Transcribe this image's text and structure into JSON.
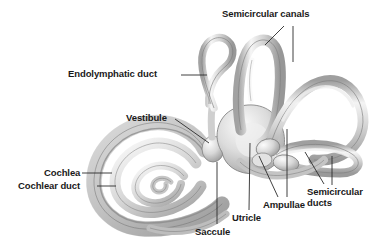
{
  "figure": {
    "style": "grayscale anatomical illustration",
    "background_color": "#ffffff",
    "label_color": "#1a1a1a",
    "leader_color": "#2b2b2b",
    "structure_fill_light": "#fdfdfd",
    "structure_fill_mid": "#c9c9c9",
    "structure_fill_dark": "#8f8f8f",
    "structure_outline": "#6e6e6e"
  },
  "labels": [
    {
      "id": "semicircular-canals",
      "text": "Semicircular canals",
      "x": 222,
      "y": 8,
      "lines": 1
    },
    {
      "id": "endolymphatic-duct",
      "text": "Endolymphatic duct",
      "x": 68,
      "y": 68,
      "lines": 1
    },
    {
      "id": "vestibule",
      "text": "Vestibule",
      "x": 126,
      "y": 112,
      "lines": 1
    },
    {
      "id": "cochlea",
      "text": "Cochlea",
      "x": 44,
      "y": 168,
      "lines": 1
    },
    {
      "id": "cochlear-duct",
      "text": "Cochlear duct",
      "x": 18,
      "y": 181,
      "lines": 1
    },
    {
      "id": "saccule",
      "text": "Saccule",
      "x": 195,
      "y": 226,
      "lines": 1
    },
    {
      "id": "utricle",
      "text": "Utricle",
      "x": 232,
      "y": 212,
      "lines": 1
    },
    {
      "id": "ampullae",
      "text": "Ampullae",
      "x": 263,
      "y": 199,
      "lines": 1
    },
    {
      "id": "semicircular-ducts",
      "text": "Semicircular ducts",
      "x": 307,
      "y": 187,
      "lines": 2
    }
  ],
  "anatomy": {
    "parts": [
      "cochlea spiral",
      "cochlear duct",
      "vestibule",
      "saccule",
      "utricle",
      "endolymphatic duct",
      "anterior semicircular canal",
      "posterior semicircular canal",
      "lateral semicircular canal",
      "ampullae"
    ]
  }
}
